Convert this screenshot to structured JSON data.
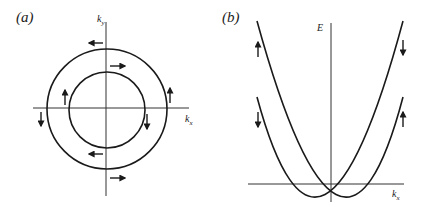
{
  "figure": {
    "panel_a": {
      "label": "(a)",
      "x_axis_label": "k",
      "x_axis_sub": "x",
      "y_axis_label": "k",
      "y_axis_sub": "y",
      "description": "Two concentric spin-split Fermi circles in k-space with opposite spin chirality",
      "circles": [
        {
          "name": "outer",
          "radius_px": 60
        },
        {
          "name": "inner",
          "radius_px": 38
        }
      ],
      "spin_arrows": [
        {
          "location": "outer-top",
          "direction": "left"
        },
        {
          "location": "inner-top",
          "direction": "right"
        },
        {
          "location": "inner-left",
          "direction": "up"
        },
        {
          "location": "outer-left",
          "direction": "down"
        },
        {
          "location": "inner-right",
          "direction": "down"
        },
        {
          "location": "outer-right",
          "direction": "up"
        },
        {
          "location": "inner-bottom",
          "direction": "left"
        },
        {
          "location": "outer-bottom",
          "direction": "right"
        }
      ]
    },
    "panel_b": {
      "label": "(b)",
      "x_axis_label": "k",
      "x_axis_sub": "x",
      "y_axis_label": "E",
      "description": "Two spin-split parabolic bands shifted in k, crossing at k=0",
      "bands": [
        {
          "name": "band-shifted-right",
          "left_arrow": "up",
          "right_arrow": "up"
        },
        {
          "name": "band-shifted-left",
          "left_arrow": "down",
          "right_arrow": "down"
        }
      ],
      "spin_arrows": [
        {
          "location": "left-upper",
          "direction": "up"
        },
        {
          "location": "left-lower",
          "direction": "down"
        },
        {
          "location": "right-upper",
          "direction": "down"
        },
        {
          "location": "right-lower",
          "direction": "up"
        }
      ]
    }
  },
  "colors": {
    "ink": "#1a1a1a",
    "background": "#ffffff"
  }
}
